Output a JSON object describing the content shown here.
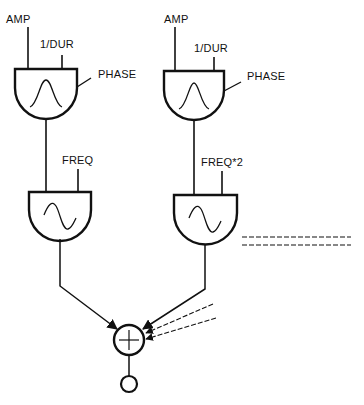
{
  "diagram": {
    "title": "",
    "colors": {
      "ink": "#111111",
      "background": "#ffffff"
    },
    "units": [
      {
        "id": "env1",
        "type": "envelope-generator",
        "shape_icon": "bell-curve",
        "inputs": {
          "amp": "AMP",
          "dur": "1/DUR",
          "phase": "PHASE"
        }
      },
      {
        "id": "env2",
        "type": "envelope-generator",
        "shape_icon": "bell-curve",
        "inputs": {
          "amp": "AMP",
          "dur": "1/DUR",
          "phase": "PHASE"
        }
      },
      {
        "id": "osc1",
        "type": "oscillator",
        "shape_icon": "sine-wave",
        "inputs": {
          "freq": "FREQ"
        }
      },
      {
        "id": "osc2",
        "type": "oscillator",
        "shape_icon": "sine-wave",
        "inputs": {
          "freq": "FREQ*2"
        }
      },
      {
        "id": "adder",
        "type": "adder",
        "symbol": "+"
      },
      {
        "id": "output",
        "type": "output"
      }
    ],
    "connections": [
      {
        "from": "env1",
        "to": "osc1",
        "port": "amplitude"
      },
      {
        "from": "env2",
        "to": "osc2",
        "port": "amplitude"
      },
      {
        "from": "osc1",
        "to": "adder"
      },
      {
        "from": "osc2",
        "to": "adder"
      },
      {
        "from": "additional-oscillators",
        "to": "adder",
        "style": "dashed",
        "count": 2
      },
      {
        "from": "adder",
        "to": "output"
      }
    ],
    "continuation_indicator": "dashed-lines"
  }
}
